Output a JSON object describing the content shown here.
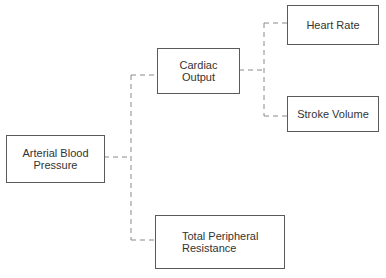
{
  "diagram": {
    "nodes": {
      "abp": "Arterial Blood\nPressure",
      "co": "Cardiac\nOutput",
      "hr": "Heart Rate",
      "sv": "Stroke Volume",
      "tpr": "Total Peripheral\nResistance"
    },
    "edges": [
      {
        "from": "abp",
        "to": "co"
      },
      {
        "from": "abp",
        "to": "tpr"
      },
      {
        "from": "co",
        "to": "hr"
      },
      {
        "from": "co",
        "to": "sv"
      }
    ],
    "line_color": "#8a8a8a",
    "border_color": "#5a5a5a"
  }
}
